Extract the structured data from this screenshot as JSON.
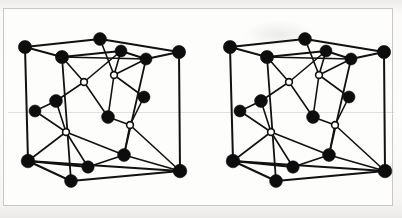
{
  "figure": {
    "title": "Crystal lattice unit cell stereo pair",
    "background_color": "#f4f3f1",
    "frame_color": "#c9c8c6",
    "panel_color": "#fdfdfc",
    "atom_fill_color": "#0d0d0d",
    "atom_open_color": "#ffffff",
    "bond_color": "#111111",
    "panel_count": 2,
    "panel_labels": [
      "left-stereo-view",
      "right-stereo-view"
    ]
  },
  "structure": {
    "atom_radius_large": 6.4,
    "atom_radius_medium": 5.6,
    "atom_radius_open": 3.3,
    "bond_width_thick": 2.0,
    "bond_width_thin": 1.5,
    "filled_atom_count": 16,
    "open_atom_count": 2,
    "atoms": [
      {
        "id": "c-back-left-top",
        "x": 21,
        "y": 38,
        "r": 6.6,
        "type": "filled"
      },
      {
        "id": "c-back-mid-top",
        "x": 96,
        "y": 30,
        "r": 6.4,
        "type": "filled"
      },
      {
        "id": "c-back-right-top",
        "x": 175,
        "y": 43,
        "r": 6.6,
        "type": "filled"
      },
      {
        "id": "c-front-left-top",
        "x": 58,
        "y": 48,
        "r": 6.6,
        "type": "filled"
      },
      {
        "id": "c-front-mid-top",
        "x": 117,
        "y": 42,
        "r": 6.0,
        "type": "filled"
      },
      {
        "id": "c-front-right-top",
        "x": 142,
        "y": 50,
        "r": 6.0,
        "type": "filled"
      },
      {
        "id": "open-upper-left",
        "x": 80,
        "y": 73,
        "r": 3.4,
        "type": "open"
      },
      {
        "id": "open-upper-right",
        "x": 110,
        "y": 66,
        "r": 3.4,
        "type": "open"
      },
      {
        "id": "c-mid-left",
        "x": 52,
        "y": 92,
        "r": 6.4,
        "type": "filled"
      },
      {
        "id": "c-mid-lower-left",
        "x": 31,
        "y": 102,
        "r": 6.0,
        "type": "filled"
      },
      {
        "id": "c-mid-right",
        "x": 140,
        "y": 88,
        "r": 6.0,
        "type": "filled"
      },
      {
        "id": "c-mid-lower-right",
        "x": 104,
        "y": 108,
        "r": 6.4,
        "type": "filled"
      },
      {
        "id": "open-lower-left",
        "x": 62,
        "y": 123,
        "r": 3.4,
        "type": "open"
      },
      {
        "id": "open-lower-right",
        "x": 126,
        "y": 116,
        "r": 3.4,
        "type": "open"
      },
      {
        "id": "c-front-left-bot",
        "x": 24,
        "y": 152,
        "r": 6.8,
        "type": "filled"
      },
      {
        "id": "c-front-mid-bot",
        "x": 84,
        "y": 158,
        "r": 6.2,
        "type": "filled"
      },
      {
        "id": "c-back-mid-bot",
        "x": 67,
        "y": 172,
        "r": 6.4,
        "type": "filled"
      },
      {
        "id": "c-back-right-bot",
        "x": 120,
        "y": 146,
        "r": 6.4,
        "type": "filled"
      },
      {
        "id": "c-front-right-bot",
        "x": 176,
        "y": 162,
        "r": 6.8,
        "type": "filled"
      }
    ],
    "bonds": [
      {
        "from": "c-back-left-top",
        "to": "c-back-mid-top",
        "w": 2.0
      },
      {
        "from": "c-back-mid-top",
        "to": "c-back-right-top",
        "w": 2.0
      },
      {
        "from": "c-back-left-top",
        "to": "c-front-left-top",
        "w": 2.0
      },
      {
        "from": "c-front-left-top",
        "to": "c-front-mid-top",
        "w": 2.0
      },
      {
        "from": "c-front-mid-top",
        "to": "c-front-right-top",
        "w": 2.0
      },
      {
        "from": "c-front-right-top",
        "to": "c-back-right-top",
        "w": 2.0
      },
      {
        "from": "c-front-left-top",
        "to": "c-front-right-top",
        "w": 1.6
      },
      {
        "from": "c-back-left-top",
        "to": "c-front-left-bot",
        "w": 2.0
      },
      {
        "from": "c-back-right-top",
        "to": "c-front-right-bot",
        "w": 2.0
      },
      {
        "from": "c-front-left-top",
        "to": "c-back-mid-bot",
        "w": 1.8
      },
      {
        "from": "c-front-right-top",
        "to": "c-back-right-bot",
        "w": 1.8
      },
      {
        "from": "c-front-left-top",
        "to": "open-upper-left",
        "w": 1.6
      },
      {
        "from": "c-front-mid-top",
        "to": "open-upper-left",
        "w": 1.6
      },
      {
        "from": "c-front-mid-top",
        "to": "open-upper-right",
        "w": 1.6
      },
      {
        "from": "c-front-right-top",
        "to": "open-upper-right",
        "w": 1.6
      },
      {
        "from": "c-back-mid-top",
        "to": "open-upper-right",
        "w": 1.6
      },
      {
        "from": "open-upper-left",
        "to": "c-mid-left",
        "w": 1.6
      },
      {
        "from": "open-upper-left",
        "to": "c-mid-lower-right",
        "w": 1.6
      },
      {
        "from": "open-upper-right",
        "to": "c-mid-right",
        "w": 1.6
      },
      {
        "from": "open-upper-right",
        "to": "c-mid-lower-right",
        "w": 1.6
      },
      {
        "from": "c-mid-left",
        "to": "c-mid-lower-left",
        "w": 1.6
      },
      {
        "from": "c-mid-left",
        "to": "open-lower-left",
        "w": 1.6
      },
      {
        "from": "c-mid-lower-left",
        "to": "open-lower-left",
        "w": 1.6
      },
      {
        "from": "c-mid-lower-right",
        "to": "open-lower-right",
        "w": 1.6
      },
      {
        "from": "c-mid-right",
        "to": "open-lower-right",
        "w": 1.6
      },
      {
        "from": "open-lower-left",
        "to": "c-front-left-bot",
        "w": 1.6
      },
      {
        "from": "open-lower-left",
        "to": "c-front-mid-bot",
        "w": 1.6
      },
      {
        "from": "open-lower-left",
        "to": "c-back-right-bot",
        "w": 1.6
      },
      {
        "from": "open-lower-right",
        "to": "c-back-right-bot",
        "w": 1.6
      },
      {
        "from": "open-lower-right",
        "to": "c-front-right-bot",
        "w": 1.6
      },
      {
        "from": "c-front-left-bot",
        "to": "c-front-mid-bot",
        "w": 1.8
      },
      {
        "from": "c-front-mid-bot",
        "to": "c-back-right-bot",
        "w": 1.8
      },
      {
        "from": "c-front-left-bot",
        "to": "c-back-mid-bot",
        "w": 2.0
      },
      {
        "from": "c-back-mid-bot",
        "to": "c-front-right-bot",
        "w": 2.0
      },
      {
        "from": "c-front-left-bot",
        "to": "c-front-right-bot",
        "w": 2.0
      },
      {
        "from": "c-back-right-bot",
        "to": "c-front-right-bot",
        "w": 1.8
      }
    ],
    "vertical_edges": [
      {
        "from": "c-front-left-top",
        "to": "c-back-mid-bot"
      },
      {
        "from": "c-front-right-top",
        "to": "c-back-right-bot"
      }
    ]
  },
  "panels": [
    {
      "name": "left-stereo-view",
      "offset_x": 0,
      "offset_y": 0
    },
    {
      "name": "right-stereo-view",
      "offset_x": 205,
      "offset_y": 0
    }
  ]
}
